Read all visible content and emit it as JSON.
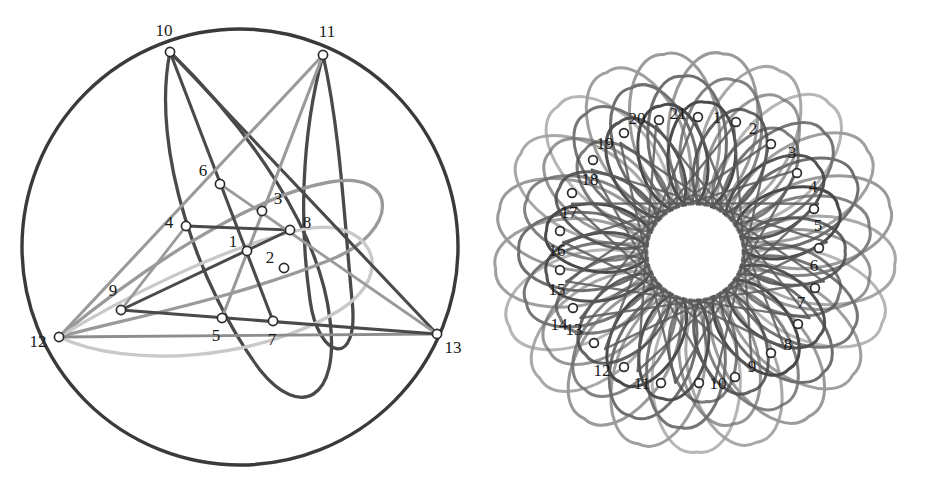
{
  "figure": {
    "background_color": "#ffffff",
    "panels": [
      {
        "id": "left",
        "name": "thirteen-point-arrangement",
        "center": [
          240,
          247
        ],
        "radius": 218,
        "outer_circle": {
          "stroke": "#3a3a3a",
          "width": 3.4
        },
        "node_count": 13,
        "nodes": [
          {
            "id": 1,
            "label": "1",
            "x": 247,
            "y": 251,
            "label_dx": -14,
            "label_dy": -8,
            "anchor": "mid"
          },
          {
            "id": 2,
            "label": "2",
            "x": 284,
            "y": 268,
            "label_dx": -14,
            "label_dy": -9,
            "anchor": "mid"
          },
          {
            "id": 3,
            "label": "3",
            "x": 262,
            "y": 211,
            "label_dx": 16,
            "label_dy": -11,
            "anchor": "mid"
          },
          {
            "id": 4,
            "label": "4",
            "x": 186,
            "y": 226,
            "label_dx": -17,
            "label_dy": -2,
            "anchor": "mid"
          },
          {
            "id": 5,
            "label": "5",
            "x": 222,
            "y": 318,
            "label_dx": -6,
            "label_dy": 19,
            "anchor": "mid"
          },
          {
            "id": 6,
            "label": "6",
            "x": 220,
            "y": 184,
            "label_dx": -17,
            "label_dy": -12,
            "anchor": "mid"
          },
          {
            "id": 7,
            "label": "7",
            "x": 273,
            "y": 321,
            "label_dx": -1,
            "label_dy": 20,
            "anchor": "mid"
          },
          {
            "id": 8,
            "label": "8",
            "x": 290,
            "y": 230,
            "label_dx": 17,
            "label_dy": -6,
            "anchor": "mid"
          },
          {
            "id": 9,
            "label": "9",
            "x": 121,
            "y": 310,
            "label_dx": -8,
            "label_dy": -18,
            "anchor": "mid"
          },
          {
            "id": 10,
            "label": "10",
            "x": 170,
            "y": 52,
            "label_dx": -6,
            "label_dy": -20,
            "anchor": "mid"
          },
          {
            "id": 11,
            "label": "11",
            "x": 323,
            "y": 55,
            "label_dx": 4,
            "label_dy": -22,
            "anchor": "mid"
          },
          {
            "id": 12,
            "label": "12",
            "x": 59,
            "y": 337,
            "label_dx": -21,
            "label_dy": 6,
            "anchor": "mid"
          },
          {
            "id": 13,
            "label": "13",
            "x": 437,
            "y": 334,
            "label_dx": 16,
            "label_dy": 15,
            "anchor": "mid"
          }
        ],
        "curves": [
          {
            "name": "loop-a",
            "stroke": "#4a4a4a",
            "width": 3.3,
            "path": "M 170 52 C 150 150 200 290 260 370 C 300 420 340 400 330 320 C 320 230 250 130 170 52 Z"
          },
          {
            "name": "loop-b",
            "stroke": "#4a4a4a",
            "width": 3.3,
            "path": "M 323 55 C 300 140 300 230 310 300 C 318 360 360 370 352 300 C 344 215 340 130 323 55 Z"
          },
          {
            "name": "loop-c",
            "stroke": "#9a9a9a",
            "width": 3.3,
            "path": "M 59 337 C 120 320 230 300 330 260 C 400 232 400 170 330 182 C 250 196 140 270 59 337 Z"
          },
          {
            "name": "loop-d",
            "stroke": "#c9c9c9",
            "width": 3.3,
            "path": "M 59 337 C 130 370 260 360 340 310 C 400 272 370 214 300 230 C 220 248 120 300 59 337 Z"
          },
          {
            "name": "chord-10-13",
            "stroke": "#4a4a4a",
            "width": 3.1,
            "path": "M 170 52 L 437 334"
          },
          {
            "name": "chord-10-7",
            "stroke": "#4a4a4a",
            "width": 3.1,
            "path": "M 170 52 L 273 321"
          },
          {
            "name": "chord-11-12",
            "stroke": "#9a9a9a",
            "width": 3.1,
            "path": "M 323 55 L 59 337"
          },
          {
            "name": "chord-11-5",
            "stroke": "#9a9a9a",
            "width": 3.1,
            "path": "M 323 55 L 222 318"
          },
          {
            "name": "chord-12-13",
            "stroke": "#8d8d8d",
            "width": 2.8,
            "path": "M 59 337 L 437 334"
          },
          {
            "name": "chord-9-13",
            "stroke": "#4a4a4a",
            "width": 3.1,
            "path": "M 121 310 L 437 334"
          },
          {
            "name": "chord-9-8",
            "stroke": "#4a4a4a",
            "width": 3.0,
            "path": "M 121 310 L 290 230"
          },
          {
            "name": "chord-9-4",
            "stroke": "#9a9a9a",
            "width": 2.8,
            "path": "M 121 310 L 186 226"
          },
          {
            "name": "chord-4-8",
            "stroke": "#4a4a4a",
            "width": 2.9,
            "path": "M 186 226 L 290 230"
          },
          {
            "name": "chord-6-13",
            "stroke": "#9a9a9a",
            "width": 2.8,
            "path": "M 220 184 L 437 334"
          }
        ]
      },
      {
        "id": "right",
        "name": "twentyone-point-rosette",
        "center": [
          695,
          252
        ],
        "radius": 202,
        "inner_hole_radius": 48,
        "node_count": 21,
        "petal_count": 21,
        "nodes": [
          {
            "id": 1,
            "label": "1",
            "x": 736,
            "y": 122,
            "label_dx": -19,
            "label_dy": -3
          },
          {
            "id": 2,
            "label": "2",
            "x": 771,
            "y": 144,
            "label_dx": -18,
            "label_dy": -14
          },
          {
            "id": 3,
            "label": "3",
            "x": 797,
            "y": 173,
            "label_dx": -5,
            "label_dy": -19
          },
          {
            "id": 4,
            "label": "4",
            "x": 814,
            "y": 209,
            "label_dx": -1,
            "label_dy": -21
          },
          {
            "id": 5,
            "label": "5",
            "x": 819,
            "y": 248,
            "label_dx": -1,
            "label_dy": -21
          },
          {
            "id": 6,
            "label": "6",
            "x": 815,
            "y": 288,
            "label_dx": -1,
            "label_dy": -21
          },
          {
            "id": 7,
            "label": "7",
            "x": 798,
            "y": 324,
            "label_dx": 3,
            "label_dy": -20
          },
          {
            "id": 8,
            "label": "8",
            "x": 771,
            "y": 353,
            "label_dx": 17,
            "label_dy": -7
          },
          {
            "id": 9,
            "label": "9",
            "x": 735,
            "y": 377,
            "label_dx": 17,
            "label_dy": -9
          },
          {
            "id": 10,
            "label": "10",
            "x": 699,
            "y": 383,
            "label_dx": 19,
            "label_dy": 2
          },
          {
            "id": 11,
            "label": "11",
            "x": 661,
            "y": 383,
            "label_dx": -19,
            "label_dy": 2
          },
          {
            "id": 12,
            "label": "12",
            "x": 624,
            "y": 367,
            "label_dx": -22,
            "label_dy": 5
          },
          {
            "id": 13,
            "label": "13",
            "x": 594,
            "y": 343,
            "label_dx": -20,
            "label_dy": -12
          },
          {
            "id": 14,
            "label": "14",
            "x": 573,
            "y": 308,
            "label_dx": -14,
            "label_dy": 18
          },
          {
            "id": 15,
            "label": "15",
            "x": 560,
            "y": 270,
            "label_dx": -3,
            "label_dy": 21
          },
          {
            "id": 16,
            "label": "16",
            "x": 560,
            "y": 231,
            "label_dx": -3,
            "label_dy": 21
          },
          {
            "id": 17,
            "label": "17",
            "x": 572,
            "y": 193,
            "label_dx": -3,
            "label_dy": 21
          },
          {
            "id": 18,
            "label": "18",
            "x": 593,
            "y": 160,
            "label_dx": -3,
            "label_dy": 21
          },
          {
            "id": 19,
            "label": "19",
            "x": 624,
            "y": 133,
            "label_dx": -19,
            "label_dy": 12
          },
          {
            "id": 20,
            "label": "20",
            "x": 659,
            "y": 120,
            "label_dx": -22,
            "label_dy": 0
          },
          {
            "id": 21,
            "label": "21",
            "x": 698,
            "y": 117,
            "label_dx": -20,
            "label_dy": -2
          }
        ],
        "petal_layers": [
          {
            "name": "outer-petals",
            "count": 21,
            "tip_radius": 200,
            "stroke": "#9a9a9a",
            "width": 3.0,
            "rotation_deg": 8
          },
          {
            "name": "mid-petals",
            "count": 21,
            "tip_radius": 176,
            "stroke": "#6f6f6f",
            "width": 3.0,
            "rotation_deg": -4
          },
          {
            "name": "inner-petals",
            "count": 21,
            "tip_radius": 150,
            "stroke": "#4a4a4a",
            "width": 3.0,
            "rotation_deg": 4
          },
          {
            "name": "star-chords",
            "count": 21,
            "tip_radius": 132,
            "stroke": "#5a5a5a",
            "width": 2.4,
            "rotation_deg": 0
          }
        ]
      }
    ],
    "palette": {
      "ink_dark": "#3a3a3a",
      "ink_mid": "#6f6f6f",
      "ink_light": "#9a9a9a",
      "ink_pale": "#c9c9c9",
      "marker_fill": "#ffffff",
      "marker_stroke": "#2b2b2b",
      "label_color": "#1a1a1a",
      "background": "#ffffff"
    }
  }
}
